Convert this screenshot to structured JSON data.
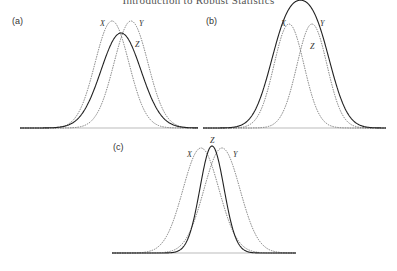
{
  "header": {
    "running_title": "Introduction to Robust Statistics"
  },
  "chart_data": [
    {
      "type": "line",
      "panel": "(a)",
      "title": "",
      "xlabel": "",
      "ylabel": "",
      "grid": false,
      "axes_visible": false,
      "description": "Two unimodal densities X and Y (dashed) with shifted locations; Z (solid) is a unimodal density between them, lower and wider.",
      "legend_labels": [
        "X",
        "Y",
        "Z"
      ],
      "series": [
        {
          "name": "X",
          "style": "dashed",
          "center": 112,
          "height": 107,
          "sigma": 17
        },
        {
          "name": "Y",
          "style": "dashed",
          "center": 131,
          "height": 107,
          "sigma": 17
        },
        {
          "name": "Z",
          "style": "solid",
          "center": 121,
          "height": 95,
          "sigma": 20
        }
      ],
      "frame": {
        "x0": 20,
        "x1": 198,
        "baseline": 128
      },
      "labels": [
        {
          "text": "X",
          "x": 100,
          "y": 26
        },
        {
          "text": "Y",
          "x": 139,
          "y": 26
        },
        {
          "text": "Z",
          "x": 135,
          "y": 47
        }
      ],
      "panel_label_pos": {
        "x": 12,
        "y": 24
      }
    },
    {
      "type": "line",
      "panel": "(b)",
      "title": "",
      "xlabel": "",
      "ylabel": "",
      "grid": false,
      "axes_visible": false,
      "description": "Two unimodal densities X and Y (dashed); Z (solid) is bimodal with modes near those of X and Y and a dip between them.",
      "legend_labels": [
        "X",
        "Y",
        "Z"
      ],
      "series": [
        {
          "name": "X",
          "style": "dashed",
          "center": 289,
          "height": 104,
          "sigma": 15
        },
        {
          "name": "Y",
          "style": "dashed",
          "center": 312,
          "height": 104,
          "sigma": 15
        },
        {
          "name": "Z",
          "style": "solid",
          "components": [
            {
              "center": 286,
              "height": 92,
              "sigma": 17
            },
            {
              "center": 315,
              "height": 92,
              "sigma": 17
            }
          ]
        }
      ],
      "frame": {
        "x0": 203,
        "x1": 386,
        "baseline": 128
      },
      "labels": [
        {
          "text": "X",
          "x": 281,
          "y": 26
        },
        {
          "text": "Y",
          "x": 320,
          "y": 26
        },
        {
          "text": "Z",
          "x": 310,
          "y": 49
        }
      ],
      "panel_label_pos": {
        "x": 206,
        "y": 24
      }
    },
    {
      "type": "line",
      "panel": "(c)",
      "title": "",
      "xlabel": "",
      "ylabel": "",
      "grid": false,
      "axes_visible": false,
      "description": "Two unimodal densities X and Y (dashed); Z (solid) is a narrower, peaked density centered between them.",
      "legend_labels": [
        "X",
        "Y",
        "Z"
      ],
      "series": [
        {
          "name": "X",
          "style": "dashed",
          "center": 201,
          "height": 105,
          "sigma": 18
        },
        {
          "name": "Y",
          "style": "dashed",
          "center": 222,
          "height": 105,
          "sigma": 18
        },
        {
          "name": "Z",
          "style": "solid",
          "center": 212,
          "height": 107,
          "sigma": 12
        }
      ],
      "frame": {
        "x0": 112,
        "x1": 296,
        "baseline": 253
      },
      "labels": [
        {
          "text": "X",
          "x": 187,
          "y": 157
        },
        {
          "text": "Y",
          "x": 233,
          "y": 157
        },
        {
          "text": "Z",
          "x": 210,
          "y": 143
        }
      ],
      "panel_label_pos": {
        "x": 113,
        "y": 150
      }
    }
  ]
}
